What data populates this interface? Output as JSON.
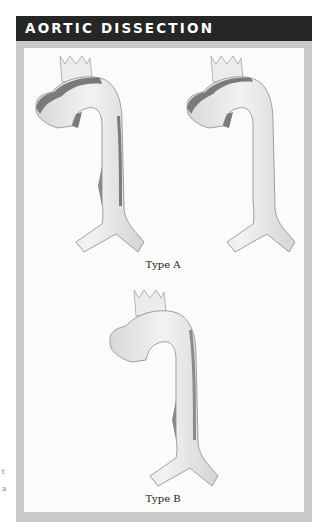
{
  "header": {
    "title": "AORTIC DISSECTION"
  },
  "figures": [
    {
      "id": "type-a-left",
      "group": "Type A",
      "false_lumen": "ascending-and-arch"
    },
    {
      "id": "type-a-right",
      "group": "Type A",
      "false_lumen": "ascending-and-arch"
    },
    {
      "id": "type-b",
      "group": "Type B",
      "false_lumen": "descending-only"
    }
  ],
  "captions": {
    "type_a": "Type A",
    "type_b": "Type B"
  },
  "colors": {
    "header_bg": "#262626",
    "frame": "#c9c9c9",
    "aorta": "#e4e4e4",
    "false_lumen": "#7a7a7a",
    "outline": "#8a8a8a"
  },
  "edge_marks": [
    "t",
    "a"
  ]
}
